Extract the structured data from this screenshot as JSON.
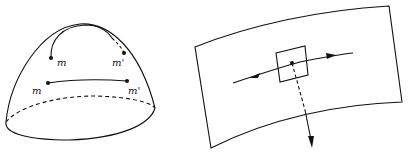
{
  "figure_left": {
    "description": "dome surface with two point pairs",
    "labels": {
      "upper_m": "m",
      "upper_m_prime": "m'",
      "lower_m": "m",
      "lower_m_prime": "m'"
    }
  },
  "figure_right": {
    "description": "curved surface patch with tangent square, tangent vector arrows and dashed normal arrow"
  },
  "colors": {
    "stroke": "#111111",
    "background": "#ffffff"
  }
}
